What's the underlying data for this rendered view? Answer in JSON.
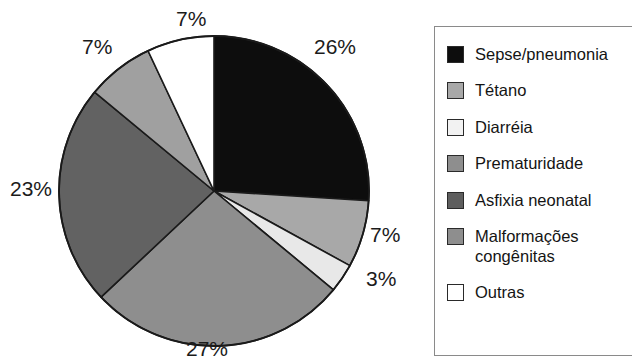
{
  "chart_data": {
    "type": "pie",
    "title": "",
    "subtitle": "",
    "xlabel": "",
    "ylabel": "",
    "legend_position": "right",
    "grid": false,
    "unit": "%",
    "start_angle_deg": 0,
    "direction": "clockwise",
    "categories": [
      "Sepse/pneumonia",
      "Tétano",
      "Diarréia",
      "Prematuridade",
      "Asfixia neonatal",
      "Malformações congênitas",
      "Outras"
    ],
    "values": [
      26,
      7,
      3,
      27,
      23,
      7,
      7
    ],
    "data_labels": [
      "26%",
      "7%",
      "3%",
      "27%",
      "23%",
      "7%",
      "7%"
    ],
    "colors": [
      "#0d0d0d",
      "#a8a8a8",
      "#e8e8e8",
      "#8e8e8e",
      "#626262",
      "#a0a0a0",
      "#ffffff"
    ],
    "slice_outline_color": "#1a1a1a",
    "slices": [
      {
        "label": "Sepse/pneumonia",
        "value": 26,
        "data_label": "26%",
        "color": "#0d0d0d"
      },
      {
        "label": "Tétano",
        "value": 7,
        "data_label": "7%",
        "color": "#a8a8a8"
      },
      {
        "label": "Diarréia",
        "value": 3,
        "data_label": "3%",
        "color": "#e8e8e8"
      },
      {
        "label": "Prematuridade",
        "value": 27,
        "data_label": "27%",
        "color": "#8e8e8e"
      },
      {
        "label": "Asfixia neonatal",
        "value": 23,
        "data_label": "23%",
        "color": "#626262"
      },
      {
        "label": "Malformações congênitas",
        "value": 7,
        "data_label": "7%",
        "color": "#a0a0a0"
      },
      {
        "label": "Outras",
        "value": 7,
        "data_label": "7%",
        "color": "#ffffff"
      }
    ]
  },
  "labels": {
    "sepse_pct": "26%",
    "tetano_pct": "7%",
    "diarreia_pct": "3%",
    "prematuridade_pct": "27%",
    "asfixia_pct": "23%",
    "malformacoes_pct": "7%",
    "outras_pct": "7%"
  },
  "legend": {
    "items": [
      {
        "label": "Sepse/pneumonia",
        "color": "#0d0d0d"
      },
      {
        "label": "Tétano",
        "color": "#a8a8a8"
      },
      {
        "label": "Diarréia",
        "color": "#f2f2f2"
      },
      {
        "label": "Prematuridade",
        "color": "#8e8e8e"
      },
      {
        "label": "Asfixia neonatal",
        "color": "#5e5e5e"
      },
      {
        "label": "Malformações\ncongênitas",
        "color": "#8e8e8e"
      },
      {
        "label": "Outras",
        "color": "#ffffff"
      }
    ]
  }
}
